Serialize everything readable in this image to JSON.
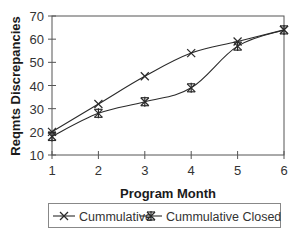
{
  "chart_data": {
    "type": "line",
    "title": "",
    "xlabel": "Program Month",
    "ylabel": "Reqmts Discrepancies",
    "x": [
      1,
      2,
      3,
      4,
      5,
      6
    ],
    "xticks": [
      "1",
      "2",
      "3",
      "4",
      "5",
      "6"
    ],
    "yticks": [
      "10",
      "20",
      "30",
      "40",
      "50",
      "60",
      "70"
    ],
    "ylim": [
      10,
      70
    ],
    "xlim": [
      1,
      6
    ],
    "grid": false,
    "legend_position": "bottom",
    "series": [
      {
        "name": "Cummulative",
        "marker": "x",
        "values": [
          20,
          32,
          44,
          54,
          59,
          64
        ]
      },
      {
        "name": "Cummulative Closed",
        "marker": "asterisk",
        "values": [
          18,
          28,
          33,
          39,
          57,
          64
        ]
      }
    ]
  },
  "colors": {
    "line": "#2a2a2a",
    "axis": "#555555",
    "text": "#1a1a1a"
  }
}
